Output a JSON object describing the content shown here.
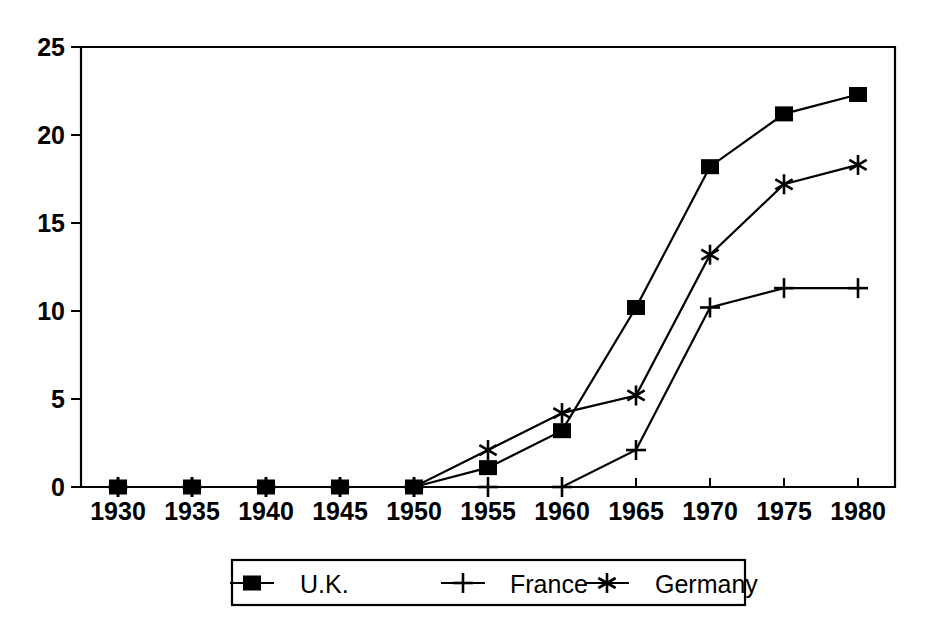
{
  "chart_data": {
    "type": "line",
    "title": "",
    "xlabel": "",
    "ylabel": "",
    "categories": [
      "1930",
      "1935",
      "1940",
      "1945",
      "1950",
      "1955",
      "1960",
      "1965",
      "1970",
      "1975",
      "1980"
    ],
    "x": [
      1930,
      1935,
      1940,
      1945,
      1950,
      1955,
      1960,
      1965,
      1970,
      1975,
      1980
    ],
    "ylim": [
      0,
      25
    ],
    "yticks": [
      0,
      5,
      10,
      15,
      20,
      25
    ],
    "ytick_labels": [
      "0",
      "5",
      "10",
      "15",
      "20",
      "25"
    ],
    "grid": false,
    "legend_position": "bottom-center",
    "series": [
      {
        "name": "U.K.",
        "marker": "filled-square",
        "values": [
          0,
          0,
          0,
          0,
          0,
          1.1,
          3.2,
          10.2,
          18.2,
          21.2,
          22.3
        ]
      },
      {
        "name": "France",
        "marker": "plus",
        "values": [
          0,
          0,
          0,
          0,
          0,
          0,
          0,
          2.1,
          10.2,
          11.3,
          11.3
        ]
      },
      {
        "name": "Germany",
        "marker": "asterisk",
        "values": [
          0,
          0,
          0,
          0,
          0,
          2.1,
          4.2,
          5.2,
          13.2,
          17.2,
          18.3
        ]
      }
    ]
  },
  "axis": {
    "y_tick_labels": [
      "25",
      "20",
      "15",
      "10",
      "5",
      "0"
    ],
    "x_tick_labels": [
      "1930",
      "1935",
      "1940",
      "1945",
      "1950",
      "1955",
      "1960",
      "1965",
      "1970",
      "1975",
      "1980"
    ]
  },
  "legend": {
    "entries": [
      {
        "label": "U.K.",
        "marker": "filled-square"
      },
      {
        "label": "France",
        "marker": "plus"
      },
      {
        "label": "Germany",
        "marker": "asterisk"
      }
    ]
  },
  "colors": {
    "ink": "#000000",
    "background": "#ffffff"
  }
}
